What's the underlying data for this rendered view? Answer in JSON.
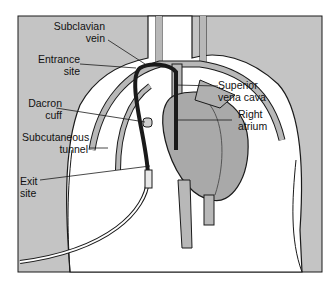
{
  "diagram": {
    "colors": {
      "background_skin": "#c4c4c4",
      "body": "#ffffff",
      "vessel_fill": "#b8b8b8",
      "heart_fill": "#a9a9a9",
      "outline": "#1a1a1a"
    },
    "labels": [
      {
        "id": "subclavian-vein",
        "line1": "Subclavian",
        "line2": "vein"
      },
      {
        "id": "entrance-site",
        "line1": "Entrance",
        "line2": "site"
      },
      {
        "id": "dacron-cuff",
        "line1": "Dacron",
        "line2": "cuff"
      },
      {
        "id": "subcutaneous-tunnel",
        "line1": "Subcutaneous",
        "line2": "tunnel"
      },
      {
        "id": "exit-site",
        "line1": "Exit",
        "line2": "site"
      },
      {
        "id": "superior-vena-cava",
        "line1": "Superior",
        "line2": "vena cava"
      },
      {
        "id": "right-atrium",
        "line1": "Right",
        "line2": "atrium"
      }
    ]
  }
}
